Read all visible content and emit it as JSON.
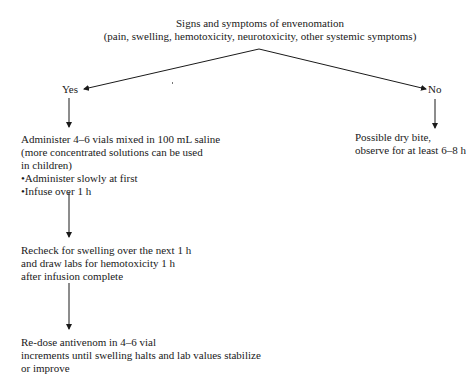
{
  "title": {
    "line1": "Signs and symptoms of envenomation",
    "line2": "(pain, swelling, hemotoxicity, neurotoxicity, other systemic symptoms)"
  },
  "branches": {
    "yes_label": "Yes",
    "no_label": "No"
  },
  "yes_path": {
    "step1": {
      "line1": "Administer 4–6 vials mixed in 100 mL saline",
      "line2": "(more concentrated solutions can be used",
      "line3": "in children)",
      "bullet1": "•Administer slowly at first",
      "bullet2": "•Infuse over 1 h"
    },
    "step2": {
      "line1": "Recheck for swelling over the next 1 h",
      "line2": "and draw labs for hemotoxicity 1 h",
      "line3": "after infusion complete"
    },
    "step3": {
      "line1": "Re-dose antivenom in 4–6 vial",
      "line2": "increments until swelling halts and lab values stabilize",
      "line3": "or improve"
    }
  },
  "no_path": {
    "line1": "Possible dry bite,",
    "line2": "observe for at least 6–8 h"
  },
  "colors": {
    "text": "#1a1a1a",
    "lines": "#1a1a1a",
    "background": "#ffffff"
  }
}
